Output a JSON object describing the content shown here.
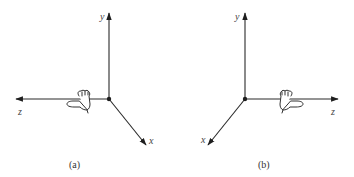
{
  "figure": {
    "panels": [
      {
        "id": "a",
        "caption": "(a)",
        "axes": {
          "x": {
            "label": "x",
            "direction": "down-right"
          },
          "y": {
            "label": "y",
            "direction": "up"
          },
          "z": {
            "label": "z",
            "direction": "left"
          }
        },
        "hand": {
          "description": "right hand, thumb along z-axis pointing left",
          "side": "left"
        }
      },
      {
        "id": "b",
        "caption": "(b)",
        "axes": {
          "x": {
            "label": "x",
            "direction": "down-left"
          },
          "y": {
            "label": "y",
            "direction": "up"
          },
          "z": {
            "label": "z",
            "direction": "right"
          }
        },
        "hand": {
          "description": "left hand, thumb along z-axis pointing right",
          "side": "right"
        }
      }
    ],
    "colors": {
      "line": "#2a2a2a",
      "text": "#444444",
      "background": "#ffffff"
    }
  }
}
